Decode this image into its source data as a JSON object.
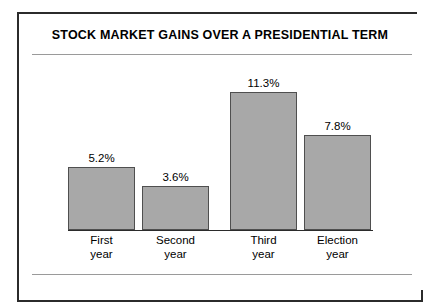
{
  "chart_data": {
    "type": "bar",
    "title": "STOCK MARKET GAINS OVER A PRESIDENTIAL TERM",
    "xlabel": "",
    "ylabel": "",
    "grid": false,
    "legend": "none",
    "ylim": [
      0,
      12
    ],
    "categories": [
      "First\nyear",
      "Second\nyear",
      "Third\nyear",
      "Election\nyear"
    ],
    "category_lines": [
      [
        "First",
        "year"
      ],
      [
        "Second",
        "year"
      ],
      [
        "Third",
        "year"
      ],
      [
        "Election",
        "year"
      ]
    ],
    "values": [
      5.2,
      3.6,
      11.3,
      7.8
    ],
    "value_labels": [
      "5.2%",
      "3.6%",
      "11.3%",
      "7.8%"
    ],
    "bar_color": "#a8a8a8",
    "bar_border_color": "#4f4f4f",
    "axis_color": "#2b2b2b",
    "rule_color": "#9a9a9a",
    "background_color": "#ffffff",
    "text_color": "#000000"
  },
  "bars": [
    {
      "label_line1": "First",
      "label_line2": "year",
      "value_label": "5.2%",
      "value": 5.2
    },
    {
      "label_line1": "Second",
      "label_line2": "year",
      "value_label": "3.6%",
      "value": 3.6
    },
    {
      "label_line1": "Third",
      "label_line2": "year",
      "value_label": "11.3%",
      "value": 11.3
    },
    {
      "label_line1": "Election",
      "label_line2": "year",
      "value_label": "7.8%",
      "value": 7.8
    }
  ]
}
